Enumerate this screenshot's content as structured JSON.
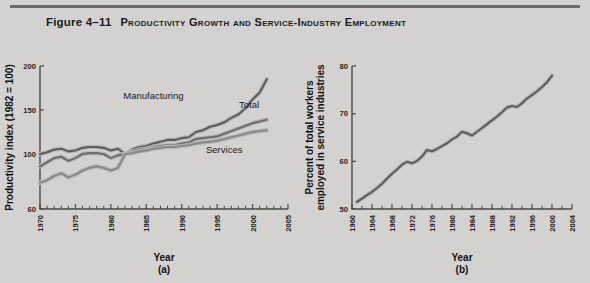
{
  "figure": {
    "number": "Figure 4–11",
    "title": "Productivity Growth and Service-Industry Employment"
  },
  "colors": {
    "background": "#d3d2d0",
    "rule": "#6c6b69",
    "axis": "#4a4947",
    "manufacturing": "#5d5c5a",
    "total": "#6e6d6b",
    "services": "#8a8987",
    "right_line": "#5d5c5a",
    "line_halo": "#b9b8b6"
  },
  "chart_data": [
    {
      "type": "line",
      "panel": "a",
      "panel_label": "(a)",
      "title": "",
      "xlabel": "Year",
      "ylabel": "Productivity index (1982 = 100)",
      "xlim": [
        1970,
        2005
      ],
      "ylim": [
        60,
        200
      ],
      "ytick_values": [
        60,
        100,
        150,
        200
      ],
      "ytick_labels": [
        "60",
        "100",
        "150",
        "200"
      ],
      "ytick_positions_nonlinear": true,
      "xtick_labels": [
        "1970",
        "1975",
        "1980",
        "1985",
        "1990",
        "1995",
        "2000",
        "2005"
      ],
      "xtick_values": [
        1970,
        1975,
        1980,
        1985,
        1990,
        1995,
        2000,
        2005
      ],
      "xtick_minor_step": 1,
      "grid": false,
      "legend": "inline-annotations",
      "annotations": [
        {
          "text": "Manufacturing",
          "x": 1986,
          "y": 163
        },
        {
          "text": "Total",
          "x": 1999.5,
          "y": 152
        },
        {
          "text": "Services",
          "x": 1996,
          "y": 101
        }
      ],
      "x": [
        1970,
        1971,
        1972,
        1973,
        1974,
        1975,
        1976,
        1977,
        1978,
        1979,
        1980,
        1981,
        1982,
        1983,
        1984,
        1985,
        1986,
        1987,
        1988,
        1989,
        1990,
        1991,
        1992,
        1993,
        1994,
        1995,
        1996,
        1997,
        1998,
        1999,
        2000,
        2001,
        2002
      ],
      "series": [
        {
          "name": "Manufacturing",
          "values": [
            100,
            102,
            105,
            106,
            103,
            104,
            107,
            108,
            108,
            107,
            104,
            106,
            100,
            105,
            108,
            109,
            112,
            114,
            116,
            116,
            118,
            119,
            125,
            127,
            131,
            133,
            136,
            141,
            145,
            152,
            162,
            170,
            185
          ]
        },
        {
          "name": "Total",
          "values": [
            91,
            94,
            97,
            98,
            95,
            97,
            100,
            101,
            101,
            100,
            97,
            99,
            100,
            103,
            105,
            106,
            108,
            109,
            110,
            110,
            112,
            113,
            117,
            118,
            119,
            120,
            123,
            126,
            129,
            132,
            135,
            137,
            139
          ]
        },
        {
          "name": "Services",
          "values": [
            79,
            81,
            84,
            86,
            83,
            85,
            88,
            90,
            91,
            90,
            88,
            90,
            100,
            101,
            103,
            104,
            106,
            107,
            108,
            108,
            109,
            110,
            112,
            113,
            114,
            115,
            117,
            119,
            121,
            123,
            125,
            126,
            127
          ]
        }
      ]
    },
    {
      "type": "line",
      "panel": "b",
      "panel_label": "(b)",
      "title": "",
      "xlabel": "Year",
      "ylabel": "Percent of total workers employed in service industries",
      "xlim": [
        1960,
        2004
      ],
      "ylim": [
        50,
        80
      ],
      "ytick_values": [
        50,
        60,
        70,
        80
      ],
      "ytick_labels": [
        "50",
        "60",
        "70",
        "80"
      ],
      "xtick_labels": [
        "1960",
        "1964",
        "1968",
        "1972",
        "1976",
        "1980",
        "1984",
        "1988",
        "1992",
        "1996",
        "2000",
        "2004"
      ],
      "xtick_values": [
        1960,
        1964,
        1968,
        1972,
        1976,
        1980,
        1984,
        1988,
        1992,
        1996,
        2000,
        2004
      ],
      "xtick_minor_step": 2,
      "grid": false,
      "legend": "none",
      "x": [
        1961,
        1962,
        1963,
        1964,
        1965,
        1966,
        1967,
        1968,
        1969,
        1970,
        1971,
        1972,
        1973,
        1974,
        1975,
        1976,
        1977,
        1978,
        1979,
        1980,
        1981,
        1982,
        1983,
        1984,
        1985,
        1986,
        1987,
        1988,
        1989,
        1990,
        1991,
        1992,
        1993,
        1994,
        1995,
        1996,
        1997,
        1998,
        1999,
        2000
      ],
      "series": [
        {
          "name": "Percent employed in service industries",
          "values": [
            51.5,
            52.2,
            52.9,
            53.6,
            54.4,
            55.3,
            56.4,
            57.4,
            58.3,
            59.3,
            59.9,
            59.6,
            60.1,
            61.0,
            62.4,
            62.1,
            62.6,
            63.2,
            63.8,
            64.6,
            65.2,
            66.2,
            65.9,
            65.4,
            66.2,
            67.0,
            67.8,
            68.6,
            69.4,
            70.3,
            71.3,
            71.6,
            71.4,
            72.2,
            73.2,
            73.9,
            74.7,
            75.6,
            76.6,
            78.0
          ]
        }
      ]
    }
  ]
}
